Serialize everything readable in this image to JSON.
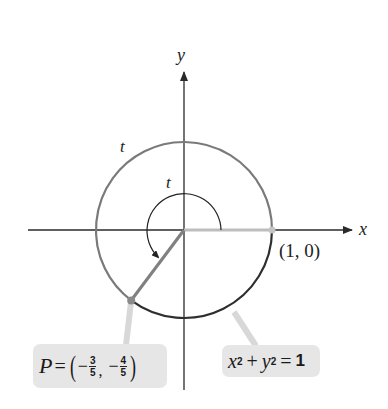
{
  "diagram": {
    "type": "unit-circle",
    "axes": {
      "x_label": "x",
      "y_label": "y"
    },
    "arc_labels": {
      "outer": "t",
      "inner": "t"
    },
    "point_start": {
      "label": "(1, 0)"
    },
    "point_P": {
      "prefix": "P",
      "equals": "=",
      "x_sign": "−",
      "x_num": "3",
      "x_den": "5",
      "separator": ",",
      "y_sign": "−",
      "y_num": "4",
      "y_den": "5"
    },
    "equation": {
      "x": "x",
      "x_exp": "2",
      "plus": "+",
      "y": "y",
      "y_exp": "2",
      "equals": "=",
      "rhs": "1"
    },
    "colors": {
      "axis": "#2a2a2a",
      "circle_traced": "#7a7a7a",
      "circle_remaining": "#2e2e2e",
      "radius_start": "#bdbdbd",
      "radius_P": "#808080",
      "callout": "#e6e6e6"
    }
  }
}
